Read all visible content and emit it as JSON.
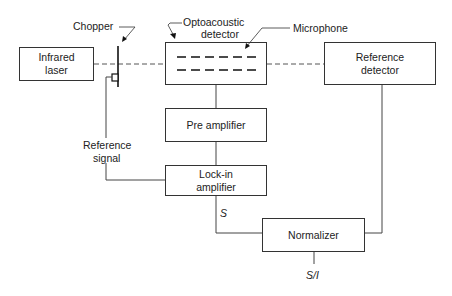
{
  "diagram": {
    "blocks": {
      "infrared_laser": {
        "line1": "Infrared",
        "line2": "laser"
      },
      "optoacoustic_detector": {
        "line1": "Optoacoustic",
        "line2": "detector"
      },
      "reference_detector": {
        "line1": "Reference",
        "line2": "detector"
      },
      "pre_amplifier": {
        "label": "Pre amplifier"
      },
      "lockin_amplifier": {
        "line1": "Lock-in",
        "line2": "amplifier"
      },
      "normalizer": {
        "label": "Normalizer"
      }
    },
    "labels": {
      "chopper": "Chopper",
      "microphone": "Microphone",
      "reference_signal_line1": "Reference",
      "reference_signal_line2": "signal",
      "signal_s": "S",
      "output": "S/I"
    },
    "colors": {
      "line": "#333333",
      "background": "#ffffff"
    }
  }
}
